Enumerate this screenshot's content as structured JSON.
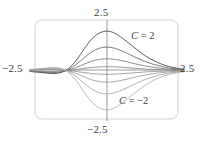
{
  "figure": {
    "title": "",
    "frame": {
      "x": 35,
      "y": 20,
      "width": 143,
      "height": 99,
      "corner_radius": 7,
      "stroke": "#cccccc"
    },
    "axes": {
      "origin_x": 107,
      "origin_y": 70,
      "x_min_px": 30,
      "x_max_px": 184,
      "y_min_px": 20,
      "y_max_px": 121,
      "stroke": "#8c8c8c"
    }
  },
  "labels": {
    "top": "2.5",
    "bottom": "−2.5",
    "left": "−2.5",
    "right": "2.5",
    "curve_positive_sym": "C",
    "curve_positive_eq": " = 2",
    "curve_negative_sym": "C",
    "curve_negative_eq": " = −2"
  },
  "chart_data": {
    "type": "line",
    "title": "",
    "xlabel": "",
    "ylabel": "",
    "xlim": [
      -2.5,
      2.5
    ],
    "ylim": [
      -2.5,
      2.5
    ],
    "xticks": [
      -2.5,
      2.5
    ],
    "xticklabels": [
      "−2.5",
      "2.5"
    ],
    "yticks": [
      -2.5,
      2.5
    ],
    "yticklabels": [
      "−2.5",
      "2.5"
    ],
    "grid": false,
    "legend": "annotations",
    "annotations": [
      {
        "text": "C = 2",
        "x": 1.2,
        "y": 1.75,
        "note": "labels the uppermost curve family bound"
      },
      {
        "text": "C = −2",
        "x": 0.55,
        "y": -1.0,
        "note": "labels the lowermost curve family bound"
      }
    ],
    "parameter_name": "C",
    "parameter_values": [
      2,
      1.2,
      0.6,
      0.2,
      -0.2,
      -0.6,
      -1.2,
      -2
    ],
    "series": [
      {
        "name": "C = 2",
        "C": 2,
        "color": "#4a4a4a",
        "width": 0.9
      },
      {
        "name": "C = 1.2",
        "C": 1.2,
        "color": "#5e5e5e",
        "width": 0.8
      },
      {
        "name": "C = 0.6",
        "C": 0.6,
        "color": "#6f6f6f",
        "width": 0.8
      },
      {
        "name": "C = 0.2",
        "C": 0.2,
        "color": "#808080",
        "width": 0.8
      },
      {
        "name": "C = -0.2",
        "C": -0.2,
        "color": "#8a8a8a",
        "width": 0.8
      },
      {
        "name": "C = -0.6",
        "C": -0.6,
        "color": "#969696",
        "width": 0.8
      },
      {
        "name": "C = -1.2",
        "C": -1.2,
        "color": "#a0a0a0",
        "width": 0.8
      },
      {
        "name": "C = -2",
        "C": -2,
        "color": "#ababab",
        "width": 0.8
      }
    ],
    "x": [
      -2.5,
      -2.25,
      -2.0,
      -1.75,
      -1.5,
      -1.25,
      -1.0,
      -0.75,
      -0.5,
      -0.25,
      0,
      0.25,
      0.5,
      0.75,
      1.0,
      1.25,
      1.5,
      1.75,
      2.0,
      2.25,
      2.5
    ],
    "curve_family_note": "Each curve is a bump/transition profile; all curves converge toward 0 at x = ±2.5 and are scaled by the parameter C. Positive C gives a hump above the x-axis, negative C a trough below.",
    "series_values": [
      {
        "name": "C = 2",
        "values": [
          -0.05,
          -0.08,
          -0.12,
          -0.15,
          -0.1,
          0.1,
          0.5,
          1.05,
          1.55,
          1.85,
          1.95,
          1.85,
          1.6,
          1.3,
          1.0,
          0.72,
          0.5,
          0.33,
          0.2,
          0.12,
          0.06
        ]
      },
      {
        "name": "C = 1.2",
        "values": [
          -0.04,
          -0.07,
          -0.1,
          -0.12,
          -0.08,
          0.05,
          0.3,
          0.62,
          0.92,
          1.1,
          1.16,
          1.1,
          0.96,
          0.78,
          0.6,
          0.44,
          0.31,
          0.21,
          0.13,
          0.08,
          0.04
        ]
      },
      {
        "name": "C = 0.6",
        "values": [
          -0.03,
          -0.05,
          -0.07,
          -0.09,
          -0.06,
          0.02,
          0.15,
          0.31,
          0.46,
          0.55,
          0.58,
          0.55,
          0.48,
          0.39,
          0.3,
          0.22,
          0.16,
          0.11,
          0.07,
          0.04,
          0.02
        ]
      },
      {
        "name": "C = 0.2",
        "values": [
          -0.02,
          -0.03,
          -0.04,
          -0.05,
          -0.03,
          0.0,
          0.05,
          0.1,
          0.15,
          0.18,
          0.19,
          0.18,
          0.16,
          0.13,
          0.1,
          0.07,
          0.05,
          0.04,
          0.02,
          0.01,
          0.01
        ]
      },
      {
        "name": "C = -0.2",
        "values": [
          0.02,
          0.03,
          0.04,
          0.05,
          0.03,
          0.0,
          -0.05,
          -0.1,
          -0.15,
          -0.18,
          -0.19,
          -0.18,
          -0.16,
          -0.13,
          -0.1,
          -0.07,
          -0.05,
          -0.04,
          -0.02,
          -0.01,
          -0.01
        ]
      },
      {
        "name": "C = -0.6",
        "values": [
          0.03,
          0.05,
          0.07,
          0.09,
          0.06,
          -0.02,
          -0.15,
          -0.31,
          -0.46,
          -0.55,
          -0.58,
          -0.55,
          -0.48,
          -0.39,
          -0.3,
          -0.22,
          -0.16,
          -0.11,
          -0.07,
          -0.04,
          -0.02
        ]
      },
      {
        "name": "C = -1.2",
        "values": [
          0.04,
          0.07,
          0.1,
          0.12,
          0.08,
          -0.05,
          -0.3,
          -0.62,
          -0.92,
          -1.1,
          -1.16,
          -1.1,
          -0.96,
          -0.78,
          -0.6,
          -0.44,
          -0.31,
          -0.21,
          -0.13,
          -0.08,
          -0.04
        ]
      },
      {
        "name": "C = -2",
        "values": [
          0.05,
          0.08,
          0.12,
          0.15,
          0.1,
          -0.1,
          -0.5,
          -1.05,
          -1.55,
          -1.85,
          -1.95,
          -1.85,
          -1.6,
          -1.3,
          -1.0,
          -0.72,
          -0.5,
          -0.33,
          -0.2,
          -0.12,
          -0.06
        ]
      }
    ]
  }
}
